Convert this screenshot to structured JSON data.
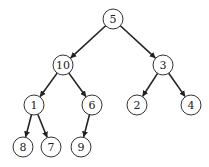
{
  "diagram": {
    "type": "binary-tree",
    "node_radius": 10,
    "colors": {
      "stroke": "#333333",
      "fill": "#ffffff",
      "text": "#222222"
    },
    "nodes": [
      {
        "id": "n5",
        "label": "5",
        "x": 113,
        "y": 19
      },
      {
        "id": "n10",
        "label": "10",
        "x": 63,
        "y": 65
      },
      {
        "id": "n3",
        "label": "3",
        "x": 163,
        "y": 65
      },
      {
        "id": "n1",
        "label": "1",
        "x": 34,
        "y": 105
      },
      {
        "id": "n6",
        "label": "6",
        "x": 92,
        "y": 105
      },
      {
        "id": "n2",
        "label": "2",
        "x": 137,
        "y": 105
      },
      {
        "id": "n4",
        "label": "4",
        "x": 191,
        "y": 105
      },
      {
        "id": "n8",
        "label": "8",
        "x": 23,
        "y": 147
      },
      {
        "id": "n7",
        "label": "7",
        "x": 51,
        "y": 147
      },
      {
        "id": "n9",
        "label": "9",
        "x": 81,
        "y": 147
      }
    ],
    "edges": [
      {
        "from": "n5",
        "to": "n10"
      },
      {
        "from": "n5",
        "to": "n3"
      },
      {
        "from": "n10",
        "to": "n1"
      },
      {
        "from": "n10",
        "to": "n6"
      },
      {
        "from": "n3",
        "to": "n2"
      },
      {
        "from": "n3",
        "to": "n4"
      },
      {
        "from": "n1",
        "to": "n8"
      },
      {
        "from": "n1",
        "to": "n7"
      },
      {
        "from": "n6",
        "to": "n9"
      }
    ]
  }
}
